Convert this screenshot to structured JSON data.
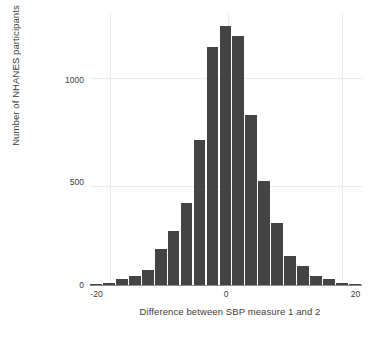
{
  "chart_data": {
    "type": "bar",
    "title": "",
    "subtitle": "",
    "xlabel": "Difference between SBP measure 1 and 2",
    "ylabel": "Number of NHANES participants",
    "xlim": [
      -21,
      21
    ],
    "ylim": [
      0,
      1320
    ],
    "xticks": [
      -20,
      0,
      20
    ],
    "xtick_labels": [
      "-20",
      "0",
      "20"
    ],
    "yticks": [
      0,
      500,
      1000
    ],
    "ytick_labels": [
      "0",
      "500",
      "1000"
    ],
    "grid": true,
    "legend": "none",
    "bar_color": "#444444",
    "bin_width": 2,
    "categories": [
      -20,
      -18,
      -16,
      -14,
      -12,
      -10,
      -8,
      -6,
      -4,
      -2,
      0,
      2,
      4,
      6,
      8,
      10,
      12,
      14,
      16,
      18,
      20
    ],
    "values": [
      5,
      12,
      28,
      42,
      75,
      175,
      265,
      400,
      705,
      1160,
      1260,
      1215,
      830,
      505,
      300,
      140,
      95,
      45,
      28,
      12,
      5
    ],
    "series": [
      {
        "name": "NHANES participants",
        "values": [
          5,
          12,
          28,
          42,
          75,
          175,
          265,
          400,
          705,
          1160,
          1260,
          1215,
          830,
          505,
          300,
          140,
          95,
          45,
          28,
          12,
          5
        ]
      }
    ]
  },
  "axis": {
    "x_title": "Difference between SBP measure 1 and 2",
    "y_title": "Number of NHANES participants"
  }
}
